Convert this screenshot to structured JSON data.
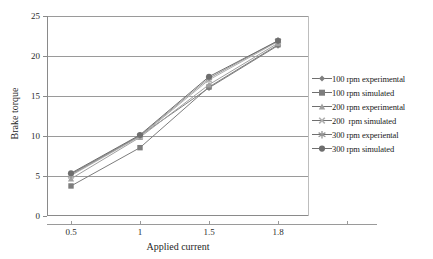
{
  "chart_data": {
    "type": "line",
    "title": "",
    "xlabel": "Applied current",
    "ylabel": "Brake torque",
    "categories": [
      "0.5",
      "1",
      "1.5",
      "1.8"
    ],
    "ylim": [
      0,
      25
    ],
    "yticks": [
      0,
      5,
      10,
      15,
      20,
      25
    ],
    "grid": true,
    "legend_position": "right",
    "series": [
      {
        "name": "100 rpm experimental",
        "marker": "diamond",
        "color": "#808080",
        "values": [
          5.2,
          10.0,
          16.0,
          21.3
        ]
      },
      {
        "name": "100 rpm simulated",
        "marker": "square",
        "color": "#7d7d7d",
        "values": [
          3.7,
          8.5,
          16.1,
          21.4
        ]
      },
      {
        "name": "200 rpm experimental",
        "marker": "triangle",
        "color": "#a0a0a0",
        "values": [
          4.6,
          9.8,
          16.4,
          21.6
        ]
      },
      {
        "name": "200  rpm simulated",
        "marker": "cross",
        "color": "#b0b0b0",
        "values": [
          5.0,
          9.9,
          17.0,
          21.8
        ]
      },
      {
        "name": "300 rpm experiental",
        "marker": "star",
        "color": "#959595",
        "values": [
          5.1,
          10.0,
          17.2,
          21.9
        ]
      },
      {
        "name": "300 rpm simulated",
        "marker": "circle",
        "color": "#6e6e6e",
        "values": [
          5.3,
          10.1,
          17.4,
          21.9
        ]
      }
    ]
  },
  "axis": {
    "y_tick_labels": [
      "25",
      "20",
      "15",
      "10",
      "5",
      "0"
    ],
    "x_tick_labels": [
      "0.5",
      "1",
      "1.5",
      "1.8"
    ],
    "x_title": "Applied current",
    "y_title": "Brake torque"
  },
  "legend": {
    "items": [
      {
        "label": "100 rpm experimental"
      },
      {
        "label": "100 rpm simulated"
      },
      {
        "label": "200 rpm experimental"
      },
      {
        "label": "200  rpm simulated"
      },
      {
        "label": "300 rpm experiental"
      },
      {
        "label": "300 rpm simulated"
      }
    ]
  }
}
